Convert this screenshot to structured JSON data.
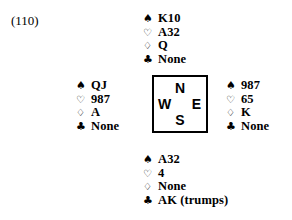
{
  "page_label": "(110)",
  "suits": {
    "spade": "♠",
    "heart": "♡",
    "diamond": "♢",
    "club": "♣"
  },
  "suit_names": {
    "spade": "spade-suit-icon",
    "heart": "heart-suit-icon",
    "diamond": "diamond-suit-icon",
    "club": "club-suit-icon"
  },
  "compass": {
    "north": "N",
    "west": "W",
    "east": "E",
    "south": "S"
  },
  "hands": {
    "north": {
      "spades": "K10",
      "hearts": "A32",
      "diamonds": "Q",
      "clubs": "None"
    },
    "west": {
      "spades": "QJ",
      "hearts": "987",
      "diamonds": "A",
      "clubs": "None"
    },
    "east": {
      "spades": "987",
      "hearts": "65",
      "diamonds": "K",
      "clubs": "None"
    },
    "south": {
      "spades": "A32",
      "hearts": "4",
      "diamonds": "None",
      "clubs": "AK (trumps)"
    }
  },
  "colors": {
    "ink": "#000000",
    "background": "#ffffff"
  }
}
